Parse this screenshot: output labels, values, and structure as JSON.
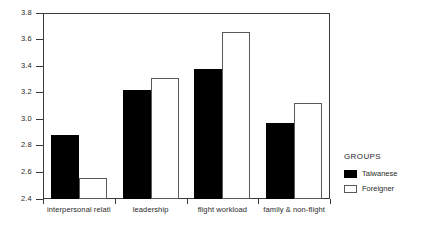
{
  "chart_data": {
    "type": "bar",
    "title": "",
    "xlabel": "",
    "ylabel": "",
    "ylim": [
      2.4,
      3.8
    ],
    "yticks": [
      "2.4",
      "2.6",
      "2.8",
      "3.0",
      "3.2",
      "3.4",
      "3.6",
      "3.8"
    ],
    "grid": false,
    "legend_position": "right",
    "legend_title": "GROUPS",
    "categories": [
      "interpersonal relati",
      "leadership",
      "flight workload",
      "family & non-flight"
    ],
    "series": [
      {
        "name": "Taiwanese",
        "color": "#000000",
        "values": [
          2.88,
          3.22,
          3.38,
          2.97
        ]
      },
      {
        "name": "Foreigner",
        "color": "#ffffff",
        "values": [
          2.56,
          3.31,
          3.66,
          3.12
        ]
      }
    ]
  }
}
